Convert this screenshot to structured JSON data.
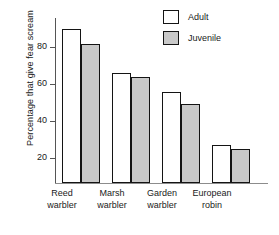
{
  "chart_data": {
    "type": "bar",
    "title": "",
    "xlabel": "",
    "ylabel": "Percentage that give fear scream",
    "categories": [
      "Reed\nwarbler",
      "Marsh\nwarbler",
      "Garden\nwarbler",
      "European\nrobin"
    ],
    "category_lines": [
      [
        "Reed",
        "warbler"
      ],
      [
        "Marsh",
        "warbler"
      ],
      [
        "Garden",
        "warbler"
      ],
      [
        "European",
        "robin"
      ]
    ],
    "series": [
      {
        "name": "Adult",
        "values": [
          84,
          60,
          49.5,
          20.5
        ],
        "color": "#ffffff"
      },
      {
        "name": "Juvenile",
        "values": [
          76,
          58,
          43,
          18.5
        ],
        "color": "#c9c9c9"
      }
    ],
    "ylim": [
      0,
      90
    ],
    "yticks": [
      20,
      40,
      60,
      80
    ],
    "ytick_labels": [
      "20",
      "40",
      "60",
      "80"
    ],
    "grid": false,
    "legend_position": "top-right"
  },
  "legend": {
    "items": [
      {
        "label": "Adult",
        "swatch": "white-square"
      },
      {
        "label": "Juvenile",
        "swatch": "gray-square"
      }
    ]
  },
  "colors": {
    "adult_fill": "#ffffff",
    "juvenile_fill": "#c9c9c9",
    "bar_outline": "#141414",
    "axis": "#555555",
    "text": "#1a1a1a",
    "background": "#ffffff"
  }
}
